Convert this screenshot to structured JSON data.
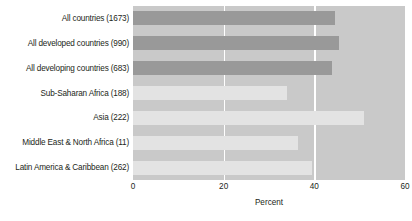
{
  "chart_data": {
    "type": "bar",
    "orientation": "horizontal",
    "title": "",
    "xlabel": "Percent",
    "ylabel": "",
    "xlim": [
      0,
      60
    ],
    "ylim": null,
    "xticks": [
      0,
      20,
      40,
      60
    ],
    "xtick_labels": [
      "0",
      "20",
      "40",
      "60"
    ],
    "grid": true,
    "grid_axis": "x",
    "grid_color": "#ffffff",
    "legend": false,
    "legend_position": "none",
    "plot_background": "#c9c9c9",
    "figure_background": "#ffffff",
    "categories": [
      "All countries (1673)",
      "All developed countries (990)",
      "All developing countries (683)",
      "Sub-Saharan Africa (188)",
      "Asia (222)",
      "Middle East & North Africa (11)",
      "Latin America & Caribbean (262)"
    ],
    "values": [
      44.6,
      45.5,
      44.0,
      34.0,
      51.0,
      36.5,
      39.5
    ],
    "bar_colors": [
      "#999999",
      "#999999",
      "#999999",
      "#e3e3e3",
      "#e3e3e3",
      "#e3e3e3",
      "#e3e3e3"
    ]
  }
}
